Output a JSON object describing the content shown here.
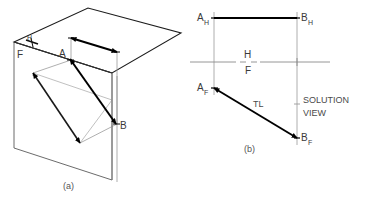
{
  "figure": {
    "title_caption_a": "(a)",
    "title_caption_b": "(b)",
    "panel_a": {
      "name": "pictorial-view",
      "labels": {
        "point_a": "A",
        "point_b": "B",
        "fold_h": "H",
        "fold_f": "F"
      },
      "geometry": {
        "horizontal_plane": "14,42 88,8 181,33 112,73",
        "frontal_plane": "14,42 14,148 112,180 112,73",
        "fold_line": "14,42 112,73",
        "ah": [
          71,
          38
        ],
        "bh": [
          117,
          52
        ],
        "af": [
          33,
          73
        ],
        "bf": [
          80,
          143
        ],
        "a_point": [
          70,
          60
        ],
        "b_point": [
          115,
          124
        ]
      }
    },
    "panel_b": {
      "name": "solution-view",
      "labels": {
        "a_h_main": "A",
        "a_h_sub": "H",
        "b_h_main": "B",
        "b_h_sub": "H",
        "a_f_main": "A",
        "a_f_sub": "F",
        "b_f_main": "B",
        "b_f_sub": "F",
        "fold_h": "H",
        "fold_f": "F",
        "true_length": "TL",
        "solution_line1": "SOLUTION",
        "solution_line2": "VIEW"
      },
      "geometry": {
        "ah": [
          214,
          18
        ],
        "bh": [
          297,
          18
        ],
        "af": [
          214,
          88
        ],
        "bf": [
          297,
          138
        ],
        "fold_y": 62,
        "fold_x_start": 190,
        "fold_x_end": 330
      }
    },
    "colors": {
      "ink_dark": "#000000",
      "ink_medium": "#555555",
      "ink_light": "#999999",
      "text": "#3a3a3a",
      "background": "#ffffff"
    }
  }
}
